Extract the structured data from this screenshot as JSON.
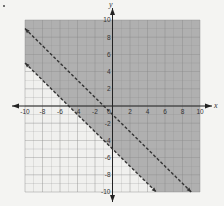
{
  "chart_data": {
    "type": "line",
    "title": "",
    "xlabel": "x",
    "ylabel": "y",
    "xlim": [
      -10,
      10
    ],
    "ylim": [
      -10,
      10
    ],
    "grid": true,
    "x_ticks": [
      "-10",
      "-8",
      "-6",
      "-4",
      "-2",
      "2",
      "4",
      "6",
      "8",
      "10"
    ],
    "y_ticks": [
      "10",
      "8",
      "6",
      "4",
      "2",
      "-2",
      "-4",
      "-6",
      "-8",
      "-10"
    ],
    "origin_label": "0",
    "series": [
      {
        "name": "boundary-upper",
        "style": "dashed",
        "equation": "y = -x - 1",
        "points": [
          [
            -10,
            9
          ],
          [
            9,
            -10
          ]
        ]
      },
      {
        "name": "boundary-lower",
        "style": "dashed",
        "equation": "y = -x - 5",
        "points": [
          [
            -10,
            5
          ],
          [
            5,
            -10
          ]
        ]
      }
    ],
    "shaded_region": "y > -x - 5",
    "colors": {
      "shade": "#a9a9a9",
      "unshaded": "#f0f0ee",
      "grid": "#8a8a8a",
      "line": "#333333",
      "axis": "#222222"
    }
  }
}
